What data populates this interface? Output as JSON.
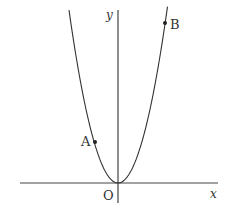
{
  "diagram": {
    "type": "parabola_graph",
    "curve": "y = a x^2 (a > 0), vertex at origin",
    "labels": {
      "x_axis": "x",
      "y_axis": "y",
      "origin": "O",
      "point_a": "A",
      "point_b": "B"
    },
    "points": [
      {
        "name": "A",
        "side": "left branch, low"
      },
      {
        "name": "B",
        "side": "right branch, high"
      }
    ],
    "colors": {
      "stroke": "#333333",
      "axis": "#444444",
      "background": "#ffffff"
    }
  }
}
